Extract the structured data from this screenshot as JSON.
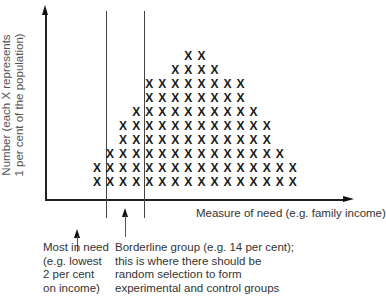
{
  "diagram": {
    "y_axis_label_line1": "Number (each X represents",
    "y_axis_label_line2": "1 per cent of the population)",
    "x_axis_label": "Measure of need (e.g. family income)",
    "marker_symbol": "X",
    "annotations": {
      "most_in_need": [
        "Most in need",
        "(e.g. lowest",
        "2 per cent",
        "on income)"
      ],
      "borderline": [
        "Borderline group (e.g. 14 per cent);",
        "this is where there should be",
        "random selection to form",
        "experimental and control groups"
      ]
    },
    "colors": {
      "axis": "#222222",
      "marks": "#1a1a1a",
      "text": "#333333"
    }
  },
  "chart_data": {
    "type": "scatter",
    "title": "",
    "xlabel": "Measure of need (e.g. family income)",
    "ylabel": "Number (each X represents 1 per cent of the population)",
    "columns": 16,
    "column_counts": [
      2,
      3,
      5,
      5,
      6,
      8,
      10,
      10,
      10,
      10,
      9,
      8,
      7,
      6,
      5,
      3
    ],
    "rows_top_to_bottom": [
      {
        "row": 10,
        "from_col": 8,
        "to_col": 9
      },
      {
        "row": 9,
        "from_col": 7,
        "to_col": 10
      },
      {
        "row": 8,
        "from_col": 5,
        "to_col": 12
      },
      {
        "row": 7,
        "from_col": 5,
        "to_col": 12
      },
      {
        "row": 6,
        "from_col": 4,
        "to_col": 13
      },
      {
        "row": 5,
        "from_col": 3,
        "to_col": 14
      },
      {
        "row": 4,
        "from_col": 3,
        "to_col": 14
      },
      {
        "row": 3,
        "from_col": 2,
        "to_col": 15
      },
      {
        "row": 2,
        "from_col": 1,
        "to_col": 16
      },
      {
        "row": 1,
        "from_col": 1,
        "to_col": 16
      }
    ],
    "total_marks": 100,
    "cutoff_lines": [
      {
        "label": "most_in_need",
        "after_col": 1,
        "percent": 2
      },
      {
        "label": "borderline_end",
        "after_col": 4,
        "percent": 14
      }
    ]
  }
}
